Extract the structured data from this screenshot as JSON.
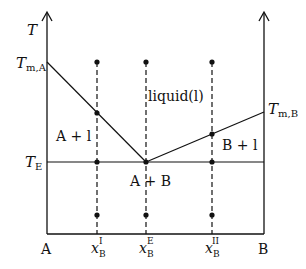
{
  "colors": {
    "line": "#111111",
    "background": "#ffffff"
  },
  "axes": {
    "y_label": "T",
    "x_left_label": "A",
    "x_right_label": "B"
  },
  "temperature_labels": {
    "t_m_a": {
      "main": "T",
      "sub": "m,A"
    },
    "t_m_b": {
      "main": "T",
      "sub": "m,B"
    },
    "t_e": {
      "main": "T",
      "sub": "E"
    }
  },
  "composition_labels": [
    {
      "main": "x",
      "sub": "B",
      "sup": "I",
      "x": 97
    },
    {
      "main": "x",
      "sub": "B",
      "sup": "E",
      "x": 146
    },
    {
      "main": "x",
      "sub": "B",
      "sup": "II",
      "x": 212
    }
  ],
  "region_labels": {
    "liquid": "liquid(l)",
    "a_plus_l": "A + l",
    "b_plus_l": "B + l",
    "a_plus_b": "A + B"
  },
  "geometry": {
    "left_x": 47,
    "right_x": 264,
    "top_y": 12,
    "base_y": 234,
    "tma_y": 62,
    "tmb_y": 112,
    "te_y": 162,
    "eutectic_x": 146,
    "dot_top_y": 62,
    "dot_bottom_y": 215,
    "liquidus_points": [
      {
        "x": 97,
        "y": 113
      },
      {
        "x": 212,
        "y": 134
      }
    ]
  }
}
